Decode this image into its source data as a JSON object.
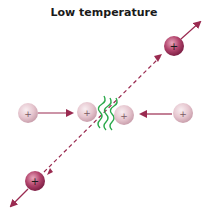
{
  "diagram": {
    "title": "Low temperature",
    "colors": {
      "ion_light": "#e8c8d0",
      "ion_dark": "#a8355e",
      "arrow": "#9a2a50",
      "wave": "#2aa84a"
    },
    "particles": [
      {
        "id": "ion-top-right",
        "cx": 174,
        "cy": 46,
        "style": "dark",
        "label": "+"
      },
      {
        "id": "ion-left",
        "cx": 28,
        "cy": 113,
        "style": "light",
        "label": "+"
      },
      {
        "id": "ion-center-left",
        "cx": 87,
        "cy": 112,
        "style": "light",
        "label": "+"
      },
      {
        "id": "ion-center-right",
        "cx": 124,
        "cy": 115,
        "style": "light",
        "label": "+"
      },
      {
        "id": "ion-right",
        "cx": 183,
        "cy": 113,
        "style": "light",
        "label": "+"
      },
      {
        "id": "ion-bottom-left",
        "cx": 35,
        "cy": 181,
        "style": "dark",
        "label": "+"
      }
    ],
    "charge_symbol": "+"
  }
}
